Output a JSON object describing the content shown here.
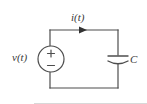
{
  "figure": {
    "kind": "circuit-schematic",
    "background_color": "#ffffff",
    "line_color": "#4d4d4d",
    "text_color": "#3a3a3a"
  },
  "labels": {
    "current": "i(t)",
    "voltage_source": "v(t)",
    "capacitor": "C",
    "polarity_positive": "+",
    "polarity_negative": "−"
  },
  "components": {
    "voltage_source": {
      "name": "v(t)",
      "type": "independent-voltage-source",
      "symbol": "circle-with-plus-minus",
      "center": [
        51,
        59
      ],
      "radius": 13,
      "terminal_top_polarity": "+",
      "terminal_bottom_polarity": "−"
    },
    "capacitor": {
      "name": "C",
      "type": "capacitor",
      "symbol": "straight-plate-and-curved-plate",
      "center": [
        118,
        59
      ],
      "plate_width": 20
    },
    "current_arrow": {
      "name": "i(t)",
      "direction": "rightward-clockwise",
      "position": [
        84,
        30
      ]
    }
  },
  "geometry": {
    "loop": {
      "left_x": 50,
      "right_x": 118,
      "top_y": 30,
      "bottom_y": 88
    }
  }
}
